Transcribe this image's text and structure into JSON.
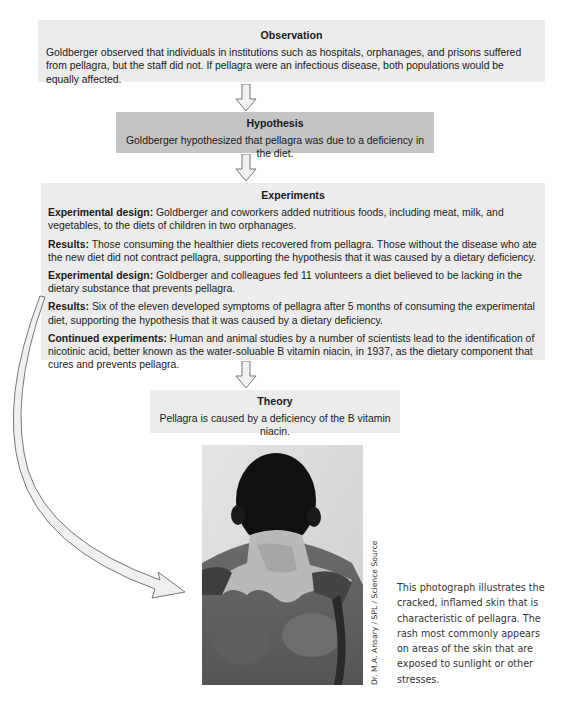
{
  "observation": {
    "title": "Observation",
    "text": "Goldberger observed that individuals in institutions such as hospitals, orphanages, and prisons suffered from pellagra, but the staff did not. If pellagra were an infectious disease, both populations would be equally affected."
  },
  "hypothesis": {
    "title": "Hypothesis",
    "text": "Goldberger hypothesized that pellagra was due to a deficiency in the diet."
  },
  "experiments": {
    "title": "Experiments",
    "items": [
      {
        "label": "Experimental design:",
        "text": " Goldberger and coworkers added nutritious foods, including meat, milk, and vegetables, to the diets of children in two orphanages."
      },
      {
        "label": "Results:",
        "text": " Those consuming the healthier diets recovered from pellagra. Those without the disease who ate the new diet did not contract pellagra, supporting the hypothesis that it was caused by a dietary deficiency."
      },
      {
        "label": "Experimental design:",
        "text": " Goldberger and colleagues fed 11 volunteers a diet believed to be lacking in the dietary substance that prevents pellagra."
      },
      {
        "label": "Results:",
        "text": " Six of the eleven developed symptoms of pellagra after 5 months of consuming the experimental diet, supporting the hypothesis that it was caused by a dietary deficiency."
      },
      {
        "label": "Continued experiments:",
        "text": " Human and animal studies by a number of scientists lead to the identification of nicotinic acid, better known as the water-soluable B vitamin niacin, in 1937, as the dietary component that cures and prevents pellagra."
      }
    ]
  },
  "theory": {
    "title": "Theory",
    "text": "Pellagra is caused by a deficiency of the B vitamin niacin."
  },
  "photo": {
    "description": "Black-and-white photograph of a man's back showing pellagra rash on neck and shoulders",
    "credit": "Dr. M.A. Ansary / SPL / Science Source"
  },
  "caption": {
    "text": "This photograph illustrates the cracked, inflamed skin that is characteristic of pellagra. The rash most commonly appears on areas of the skin that are exposed to sunlight or other stresses."
  },
  "colors": {
    "box_light": "#ececec",
    "box_dark": "#c4c4c4",
    "arrow_fill": "#f2f2f2",
    "arrow_stroke": "#777777"
  }
}
